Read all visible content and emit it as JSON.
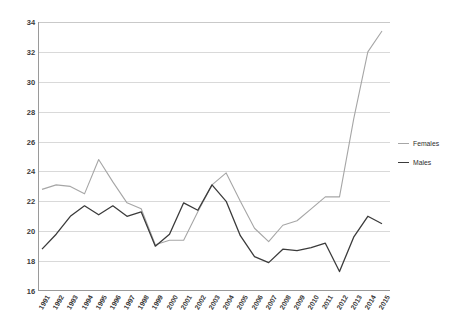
{
  "chart_data": {
    "type": "line",
    "title": "",
    "xlabel": "",
    "ylabel": "",
    "ylim": [
      16,
      34
    ],
    "ytick_step": 2,
    "yticks": [
      34,
      32,
      30,
      28,
      26,
      24,
      22,
      20,
      18,
      16
    ],
    "grid": true,
    "legend_position": "right",
    "categories": [
      "1991",
      "1992",
      "1993",
      "1994",
      "1995",
      "1996",
      "1997",
      "1998",
      "1999",
      "2000",
      "2001",
      "2002",
      "2003",
      "2004",
      "2005",
      "2006",
      "2007",
      "2008",
      "2009",
      "2010",
      "2011",
      "2012",
      "2013",
      "2014",
      "2015"
    ],
    "series": [
      {
        "name": "Females",
        "color": "#a6a6a6",
        "values": [
          22.8,
          23.1,
          23.0,
          22.5,
          24.8,
          23.3,
          21.9,
          21.5,
          19.1,
          19.4,
          19.4,
          21.3,
          23.1,
          23.9,
          22.0,
          20.2,
          19.3,
          20.4,
          20.7,
          21.5,
          22.3,
          22.3,
          27.5,
          32.0,
          33.4
        ]
      },
      {
        "name": "Males",
        "color": "#3b3b3b",
        "values": [
          18.8,
          19.8,
          21.0,
          21.7,
          21.1,
          21.7,
          21.0,
          21.3,
          19.0,
          19.8,
          21.9,
          21.4,
          23.1,
          22.0,
          19.7,
          18.3,
          17.9,
          18.8,
          18.7,
          18.9,
          19.2,
          17.3,
          19.6,
          21.0,
          20.5
        ]
      }
    ]
  },
  "legend": {
    "entries": [
      {
        "label": "Females",
        "swatch": "females-line-swatch"
      },
      {
        "label": "Males",
        "swatch": "males-line-swatch"
      }
    ]
  }
}
